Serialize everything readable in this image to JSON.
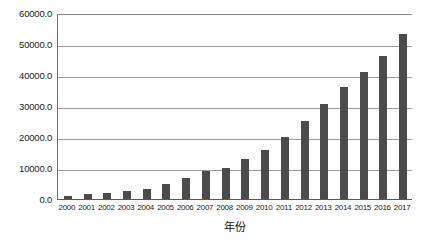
{
  "chart_data": {
    "type": "bar",
    "title": "",
    "subtitle": "",
    "xlabel": "年份",
    "ylabel": "",
    "grid": true,
    "legend": false,
    "legend_position": "none",
    "bar_color": "#4b4b4b",
    "gridline_color": "#9a9a9a",
    "axis_color": "#5a5a5a",
    "background": "#ffffff",
    "xlim": [
      "2000",
      "2017"
    ],
    "ylim": [
      0,
      60000
    ],
    "ytick_step": 10000,
    "ytick_labels": [
      "0.0",
      "10000.0",
      "20000.0",
      "30000.0",
      "40000.0",
      "50000.0",
      "60000.0"
    ],
    "ytick_values": [
      0,
      10000,
      20000,
      30000,
      40000,
      50000,
      60000
    ],
    "categories": [
      "2000",
      "2001",
      "2002",
      "2003",
      "2004",
      "2005",
      "2006",
      "2007",
      "2008",
      "2009",
      "2010",
      "2011",
      "2012",
      "2013",
      "2014",
      "2015",
      "2016",
      "2017"
    ],
    "values": [
      1000,
      1500,
      2000,
      2500,
      3400,
      4800,
      6700,
      9000,
      10100,
      13100,
      16000,
      20000,
      25200,
      30700,
      36400,
      41200,
      46500,
      53400
    ]
  }
}
